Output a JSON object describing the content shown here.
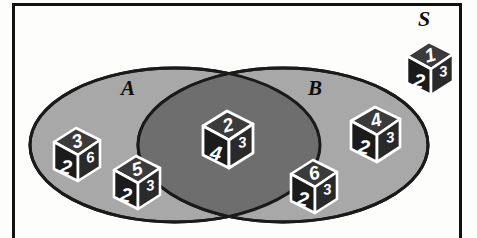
{
  "diagram": {
    "type": "venn-2-set",
    "title_label": "S",
    "universal_set_label": "S",
    "sets": [
      {
        "id": "A",
        "label": "A"
      },
      {
        "id": "B",
        "label": "B"
      }
    ],
    "colors": {
      "background": "#fdfdfc",
      "frame_stroke": "#111111",
      "set_fill": "#a8a8a8",
      "intersection_fill": "#6e6e6e",
      "ellipse_stroke": "#1a1a1a",
      "die_face_top": "#3b3b3b",
      "die_face_front": "#1b1b1b",
      "die_face_side": "#2a2a2a",
      "die_outline": "#ffffff",
      "die_number": "#ffffff"
    },
    "regions": {
      "a_only": "A only",
      "b_only": "B only",
      "intersection": "A and B",
      "outside": "outside A and B"
    }
  },
  "dice": [
    {
      "id": "die-a-1",
      "region": "a_only",
      "top": "3",
      "front": "2",
      "side": "6"
    },
    {
      "id": "die-a-2",
      "region": "a_only",
      "top": "5",
      "front": "2",
      "side": "3"
    },
    {
      "id": "die-ab-1",
      "region": "intersection",
      "top": "2",
      "front": "4",
      "side": "3"
    },
    {
      "id": "die-b-1",
      "region": "b_only",
      "top": "6",
      "front": "2",
      "side": "3"
    },
    {
      "id": "die-b-2",
      "region": "b_only",
      "top": "4",
      "front": "2",
      "side": "3"
    },
    {
      "id": "die-s-1",
      "region": "outside",
      "top": "1",
      "front": "2",
      "side": "3"
    }
  ]
}
